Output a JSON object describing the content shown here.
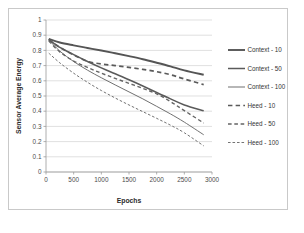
{
  "chart_data": {
    "type": "line",
    "title": "",
    "xlabel": "Epochs",
    "ylabel": "Sensor Average Energy",
    "xlim": [
      0,
      3000
    ],
    "ylim": [
      0,
      1
    ],
    "grid": true,
    "legend_position": "right",
    "xticks": [
      "0",
      "500",
      "1000",
      "1500",
      "2000",
      "2500",
      "3000"
    ],
    "xtick_values": [
      0,
      500,
      1000,
      1500,
      2000,
      2500,
      3000
    ],
    "yticks": [
      "0",
      "0.1",
      "0.2",
      "0.3",
      "0.4",
      "0.5",
      "0.6",
      "0.7",
      "0.8",
      "0.9",
      "1"
    ],
    "ytick_values": [
      0,
      0.1,
      0.2,
      0.3,
      0.4,
      0.5,
      0.6,
      0.7,
      0.8,
      0.9,
      1
    ],
    "x": [
      50,
      250,
      500,
      750,
      1000,
      1250,
      1500,
      1750,
      2000,
      2250,
      2500,
      2850
    ],
    "series": [
      {
        "name": "Context - 10",
        "style": "solid",
        "width": 1.9,
        "color": "#555555",
        "values": [
          0.875,
          0.852,
          0.833,
          0.816,
          0.799,
          0.781,
          0.762,
          0.742,
          0.719,
          0.695,
          0.669,
          0.64
        ]
      },
      {
        "name": "Context - 50",
        "style": "solid",
        "width": 1.5,
        "color": "#5a5a5a",
        "values": [
          0.872,
          0.82,
          0.772,
          0.727,
          0.685,
          0.646,
          0.607,
          0.566,
          0.523,
          0.481,
          0.441,
          0.403
        ]
      },
      {
        "name": "Context - 100",
        "style": "solid",
        "width": 0.95,
        "color": "#686868",
        "values": [
          0.87,
          0.795,
          0.727,
          0.67,
          0.62,
          0.573,
          0.527,
          0.481,
          0.432,
          0.382,
          0.328,
          0.245
        ]
      },
      {
        "name": "Heed - 10",
        "style": "dashed",
        "width": 1.7,
        "color": "#5a5a5a",
        "values": [
          0.87,
          0.82,
          0.77,
          0.728,
          0.711,
          0.7,
          0.688,
          0.675,
          0.66,
          0.64,
          0.612,
          0.575
        ]
      },
      {
        "name": "Heed - 50",
        "style": "dashed",
        "width": 1.4,
        "color": "#646464",
        "values": [
          0.862,
          0.79,
          0.73,
          0.688,
          0.65,
          0.616,
          0.583,
          0.55,
          0.514,
          0.463,
          0.404,
          0.322
        ]
      },
      {
        "name": "Heed - 100",
        "style": "dashed",
        "width": 1.0,
        "color": "#737373",
        "values": [
          0.782,
          0.718,
          0.65,
          0.59,
          0.536,
          0.487,
          0.441,
          0.397,
          0.353,
          0.308,
          0.258,
          0.172
        ]
      }
    ],
    "legend": [
      "Context - 10",
      "Context - 50",
      "Context - 100",
      "Heed - 10",
      "Heed - 50",
      "Heed - 100"
    ]
  }
}
